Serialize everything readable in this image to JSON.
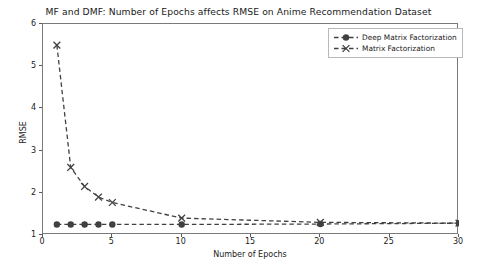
{
  "chart_data": {
    "type": "line",
    "title": "MF and DMF: Number of Epochs affects RMSE on Anime Recommendation Dataset",
    "xlabel": "Number of Epochs",
    "ylabel": "RMSE",
    "xlim": [
      0,
      30
    ],
    "ylim": [
      1,
      6
    ],
    "xticks": [
      "0",
      "5",
      "10",
      "15",
      "20",
      "25",
      "30"
    ],
    "xtick_values": [
      0,
      5,
      10,
      15,
      20,
      25,
      30
    ],
    "yticks": [
      "1",
      "2",
      "3",
      "4",
      "5",
      "6"
    ],
    "ytick_values": [
      1,
      2,
      3,
      4,
      5,
      6
    ],
    "grid": false,
    "legend_position": "upper right",
    "series": [
      {
        "name": "Deep Matrix Factorization",
        "marker": "circle",
        "linestyle": "dashed",
        "color": "#404040",
        "x": [
          1,
          2,
          3,
          4,
          5,
          10,
          20,
          30
        ],
        "values": [
          1.25,
          1.25,
          1.25,
          1.25,
          1.25,
          1.25,
          1.26,
          1.28
        ]
      },
      {
        "name": "Matrix Factorization",
        "marker": "x",
        "linestyle": "dashed",
        "color": "#404040",
        "x": [
          1,
          2,
          3,
          4,
          5,
          10,
          20,
          30
        ],
        "values": [
          5.5,
          2.6,
          2.15,
          1.9,
          1.77,
          1.4,
          1.3,
          1.28
        ]
      }
    ]
  },
  "legend": {
    "items": [
      {
        "label": "Deep Matrix Factorization"
      },
      {
        "label": "Matrix Factorization"
      }
    ]
  }
}
